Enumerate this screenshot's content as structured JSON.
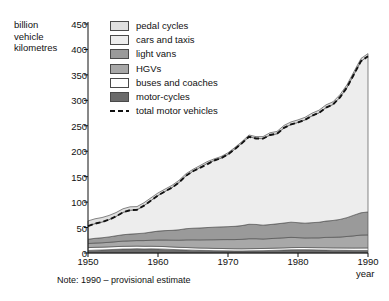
{
  "chart_data": {
    "type": "area",
    "title": "",
    "subtitle": "",
    "ylabel": "billion\nvehicle\nkilometres",
    "xlabel": "year",
    "note": "Note: 1990 – provisional estimate",
    "grid": false,
    "legend_position": "top-left-inside",
    "stacked": true,
    "xlim": [
      1950,
      1990
    ],
    "ylim": [
      0,
      450
    ],
    "yticks": [
      0,
      50,
      100,
      150,
      200,
      250,
      300,
      350,
      400,
      450
    ],
    "xticks": [
      1950,
      1960,
      1970,
      1980,
      1990
    ],
    "x": [
      1950,
      1951,
      1952,
      1953,
      1954,
      1955,
      1956,
      1957,
      1958,
      1959,
      1960,
      1961,
      1962,
      1963,
      1964,
      1965,
      1966,
      1967,
      1968,
      1969,
      1970,
      1971,
      1972,
      1973,
      1974,
      1975,
      1976,
      1977,
      1978,
      1979,
      1980,
      1981,
      1982,
      1983,
      1984,
      1985,
      1986,
      1987,
      1988,
      1989,
      1990
    ],
    "series": [
      {
        "name": "motor-cycles",
        "color": "#6b6b6b",
        "values": [
          5.0,
          5.6,
          6.0,
          6.6,
          7.2,
          7.8,
          8.0,
          8.4,
          8.0,
          8.2,
          8.0,
          7.6,
          7.0,
          6.4,
          6.0,
          5.6,
          5.2,
          5.0,
          4.6,
          4.4,
          4.2,
          4.0,
          4.0,
          4.2,
          4.4,
          4.6,
          5.0,
          5.4,
          5.8,
          6.2,
          6.4,
          6.4,
          6.2,
          6.0,
          5.8,
          5.6,
          5.4,
          5.2,
          5.0,
          5.0,
          5.0
        ]
      },
      {
        "name": "buses and coaches",
        "color": "#ffffff",
        "values": [
          5.6,
          5.6,
          5.5,
          5.4,
          5.4,
          5.3,
          5.3,
          5.2,
          5.2,
          5.1,
          5.0,
          5.0,
          4.9,
          4.8,
          4.8,
          4.7,
          4.6,
          4.6,
          4.5,
          4.5,
          4.4,
          4.4,
          4.3,
          4.3,
          4.3,
          4.3,
          4.3,
          4.3,
          4.3,
          4.4,
          4.4,
          4.4,
          4.4,
          4.4,
          4.5,
          4.5,
          4.6,
          4.7,
          4.8,
          4.9,
          5.0
        ]
      },
      {
        "name": "HGVs",
        "color": "#a8a8a8",
        "values": [
          8.0,
          8.4,
          8.6,
          9.0,
          9.6,
          10.2,
          10.6,
          10.8,
          11.2,
          11.8,
          12.6,
          13.0,
          13.4,
          14.0,
          15.0,
          15.6,
          16.0,
          16.4,
          17.0,
          17.4,
          17.8,
          18.0,
          18.6,
          19.6,
          19.4,
          18.6,
          19.0,
          19.4,
          19.8,
          20.2,
          19.4,
          18.8,
          19.2,
          19.4,
          20.4,
          20.8,
          21.4,
          22.6,
          24.0,
          25.4,
          25.6
        ]
      },
      {
        "name": "light vans",
        "color": "#9a9a9a",
        "values": [
          8.4,
          9.2,
          9.8,
          10.6,
          11.6,
          12.6,
          13.2,
          13.6,
          14.6,
          16.0,
          17.4,
          18.4,
          19.2,
          20.4,
          22.0,
          22.8,
          23.4,
          24.0,
          24.6,
          25.0,
          25.4,
          26.0,
          27.0,
          28.4,
          28.0,
          27.2,
          27.6,
          28.2,
          29.0,
          29.8,
          29.4,
          29.0,
          29.8,
          30.6,
          32.0,
          33.0,
          34.6,
          37.0,
          40.6,
          43.8,
          45.0
        ]
      },
      {
        "name": "cars and taxis",
        "color": "#ededed",
        "values": [
          26.0,
          29.0,
          31.0,
          34.0,
          38.0,
          44.0,
          47.0,
          47.0,
          54.0,
          62.0,
          70.0,
          77.0,
          84.0,
          93.0,
          104.0,
          112.0,
          119.0,
          126.0,
          131.0,
          135.0,
          142.0,
          152.0,
          162.0,
          172.0,
          169.0,
          170.0,
          176.0,
          177.0,
          187.0,
          192.0,
          197.0,
          203.0,
          210.0,
          215.0,
          223.0,
          228.0,
          240.0,
          256.0,
          277.0,
          298.0,
          306.0
        ]
      },
      {
        "name": "pedal cycles",
        "color": "#e0e0e0",
        "values": [
          10.0,
          9.4,
          8.8,
          8.2,
          7.6,
          7.0,
          6.6,
          6.2,
          5.8,
          5.4,
          5.0,
          4.6,
          4.4,
          4.2,
          4.0,
          3.8,
          3.6,
          3.4,
          3.2,
          3.2,
          3.2,
          3.2,
          3.2,
          3.4,
          3.6,
          4.0,
          4.4,
          4.6,
          4.8,
          5.0,
          5.0,
          5.0,
          5.2,
          5.2,
          5.4,
          5.2,
          5.2,
          5.2,
          5.2,
          5.2,
          5.2
        ]
      }
    ],
    "overlay_line": {
      "name": "total motor vehicles",
      "style": "dashed",
      "color": "#111111",
      "values": [
        53.0,
        57.8,
        60.9,
        65.6,
        71.8,
        79.9,
        84.1,
        85.0,
        93.0,
        103.1,
        113.0,
        121.0,
        128.5,
        138.6,
        151.8,
        160.7,
        167.2,
        174.0,
        181.7,
        186.3,
        193.8,
        204.4,
        215.9,
        228.5,
        225.1,
        224.7,
        231.9,
        234.3,
        245.9,
        252.6,
        256.6,
        261.6,
        269.6,
        275.4,
        285.7,
        291.9,
        306.0,
        325.5,
        351.4,
        377.1,
        386.6
      ]
    }
  },
  "legend": {
    "items": [
      {
        "label": "pedal cycles",
        "swatch": "#e0e0e0",
        "kind": "box"
      },
      {
        "label": "cars and taxis",
        "swatch": "#ededed",
        "kind": "box"
      },
      {
        "label": "light vans",
        "swatch": "#9a9a9a",
        "kind": "box"
      },
      {
        "label": "HGVs",
        "swatch": "#a8a8a8",
        "kind": "box"
      },
      {
        "label": "buses and coaches",
        "swatch": "#ffffff",
        "kind": "box"
      },
      {
        "label": "motor-cycles",
        "swatch": "#6b6b6b",
        "kind": "box"
      },
      {
        "label": "total motor vehicles",
        "swatch": "#111111",
        "kind": "dash"
      }
    ]
  },
  "axes": {
    "y_title": "billion\nvehicle\nkilometres",
    "x_title": "year",
    "y_tick_labels": [
      "450",
      "400",
      "350",
      "300",
      "250",
      "200",
      "150",
      "100",
      "50",
      "0"
    ],
    "x_tick_labels": [
      "1950",
      "1960",
      "1970",
      "1980",
      "1990"
    ]
  },
  "footnote": "Note: 1990 – provisional estimate"
}
